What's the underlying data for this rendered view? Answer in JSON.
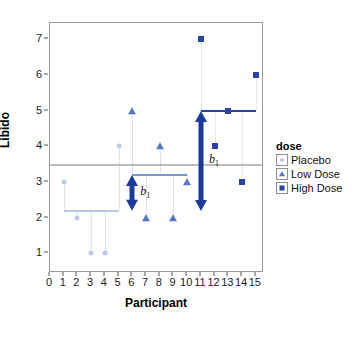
{
  "chart_data": {
    "type": "scatter",
    "title": "",
    "xlabel": "Participant",
    "ylabel": "Libido",
    "xlim": [
      0,
      15.6
    ],
    "ylim": [
      0.45,
      7.45
    ],
    "xticks": [
      0,
      1,
      2,
      3,
      4,
      5,
      6,
      7,
      8,
      9,
      10,
      11,
      12,
      13,
      14,
      15
    ],
    "yticks": [
      1,
      2,
      3,
      4,
      5,
      6,
      7
    ],
    "grid": false,
    "legend": {
      "position": "right",
      "title": "dose",
      "entries": [
        {
          "label": "Placebo",
          "marker": "circle",
          "color": "#bcc9e8"
        },
        {
          "label": "Low Dose",
          "marker": "triangle",
          "color": "#5b77c4"
        },
        {
          "label": "High Dose",
          "marker": "square",
          "color": "#2b43a8"
        }
      ]
    },
    "series": [
      {
        "name": "Placebo",
        "color": "#bcc9e8",
        "marker": "circle",
        "x": [
          1,
          2,
          3,
          4,
          5
        ],
        "y": [
          3,
          2,
          1,
          1,
          4
        ],
        "mean": 2.2,
        "mean_line": {
          "x0": 1,
          "x1": 5,
          "y": 2.2
        }
      },
      {
        "name": "Low Dose",
        "color": "#5b77c4",
        "marker": "triangle",
        "x": [
          6,
          7,
          8,
          9,
          10
        ],
        "y": [
          5,
          2,
          4,
          2,
          3
        ],
        "mean": 3.2,
        "mean_line": {
          "x0": 6,
          "x1": 10,
          "y": 3.2
        }
      },
      {
        "name": "High Dose",
        "color": "#2b43a8",
        "marker": "square",
        "x": [
          11,
          12,
          13,
          14,
          15
        ],
        "y": [
          7,
          4,
          5,
          3,
          6
        ],
        "mean": 5.0,
        "mean_line": {
          "x0": 11,
          "x1": 15,
          "y": 5.0
        }
      }
    ],
    "grand_mean": {
      "value": 3.467,
      "color": "#7d7d7d",
      "label": ""
    },
    "annotations": [
      {
        "name": "b1-arrow-low",
        "label": "b1",
        "x": 6,
        "y0": 2.2,
        "y1": 3.2,
        "color": "#1b3a9b"
      },
      {
        "name": "b1-arrow-high",
        "label": "b1",
        "x": 11,
        "y0": 2.2,
        "y1": 5.0,
        "color": "#1b3a9b"
      }
    ]
  },
  "axis": {
    "y_title": "Libido",
    "x_title": "Participant",
    "y_ticks": [
      "1",
      "2",
      "3",
      "4",
      "5",
      "6",
      "7"
    ],
    "x_ticks": [
      "0",
      "1",
      "2",
      "3",
      "4",
      "5",
      "6",
      "7",
      "8",
      "9",
      "10",
      "11",
      "12",
      "13",
      "14",
      "15"
    ]
  },
  "legend": {
    "title": "dose",
    "items": [
      {
        "label": "Placebo"
      },
      {
        "label": "Low Dose"
      },
      {
        "label": "High Dose"
      }
    ]
  },
  "annotations": {
    "b_symbol": "b",
    "b_subscript": "1"
  }
}
